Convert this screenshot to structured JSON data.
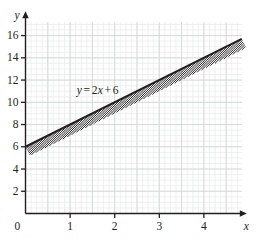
{
  "figure": {
    "width": 257,
    "height": 238,
    "background": "#ffffff",
    "ink_color": "#231f20",
    "grid_minor_color": "#e8e9ea",
    "grid_major_color": "#d2d4d6"
  },
  "axes": {
    "x_axis_label": "x",
    "y_axis_label": "y",
    "origin_label": "0",
    "x_ticks": [
      1,
      2,
      3,
      4
    ],
    "x_tick_labels": [
      "1",
      "2",
      "3",
      "4"
    ],
    "y_ticks": [
      2,
      4,
      6,
      8,
      10,
      12,
      14,
      16
    ],
    "y_tick_labels": [
      "2",
      "4",
      "6",
      "8",
      "10",
      "12",
      "14",
      "16"
    ],
    "x_arrow": true,
    "y_arrow": true
  },
  "chart_data": {
    "type": "line",
    "title": "",
    "xlabel": "x",
    "ylabel": "y",
    "xlim": [
      0,
      4.85
    ],
    "ylim": [
      0,
      17.2
    ],
    "grid": true,
    "grid_major_x_step": 0.5,
    "grid_major_y_step": 2,
    "grid_minor_x_step": 0.125,
    "grid_minor_y_step": 0.5,
    "legend": "none",
    "annotations": [
      {
        "name": "line-equation",
        "text": "y = 2x + 6",
        "x": 1.15,
        "y": 11.0
      }
    ],
    "series": [
      {
        "name": "y = 2x + 6",
        "equation": "y = 2x + 6",
        "slope": 2,
        "intercept": 6,
        "color": "#231f20",
        "line_width": 2.1,
        "x": [
          0,
          5
        ],
        "values": [
          6,
          16
        ],
        "points": [
          {
            "x": 0,
            "y": 6
          },
          {
            "x": 1,
            "y": 8
          },
          {
            "x": 2,
            "y": 10
          },
          {
            "x": 3,
            "y": 12
          },
          {
            "x": 4,
            "y": 14
          },
          {
            "x": 5,
            "y": 16
          }
        ]
      }
    ],
    "shading": {
      "name": "hatch-band-below-line",
      "style": "diagonal-hatch",
      "side": "below",
      "band_width_px": 21,
      "hatch_angle_deg": 45,
      "hatch_spacing_px": 5.0,
      "hatch_color": "#231f20"
    }
  }
}
